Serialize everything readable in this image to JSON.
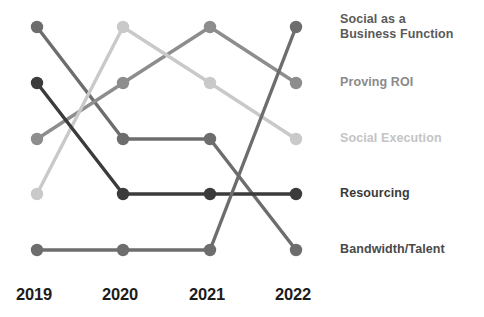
{
  "chart_data": {
    "type": "line",
    "subtype": "bump-chart",
    "title": "",
    "subtitle": "",
    "xlabel": "",
    "ylabel": "",
    "grid": false,
    "legend_position": "right",
    "categories": [
      "2019",
      "2020",
      "2021",
      "2022"
    ],
    "rank_axis": {
      "inverted": true,
      "min_rank": 1,
      "max_rank": 5,
      "note": "y position encodes rank; rank 1 is topmost"
    },
    "series": [
      {
        "name": "Bandwidth/Talent",
        "label": "Bandwidth/Talent",
        "color": "#6d6d6d",
        "label_color": "#4a4a4a",
        "values": [
          1,
          3,
          3,
          5
        ]
      },
      {
        "name": "Proving ROI",
        "label": "Proving ROI",
        "color": "#8d8d8d",
        "label_color": "#8a8a8a",
        "values": [
          3,
          2,
          1,
          2
        ]
      },
      {
        "name": "Social Execution",
        "label": "Social Execution",
        "color": "#c9c9c9",
        "label_color": "#c4c4c4",
        "values": [
          4,
          1,
          2,
          3
        ]
      },
      {
        "name": "Resourcing",
        "label": "Resourcing",
        "color": "#3b3b3b",
        "label_color": "#3a3a3a",
        "values": [
          2,
          4,
          4,
          4
        ]
      },
      {
        "name": "Social as a Business Function",
        "label": "Social as a\nBusiness Function",
        "color": "#6d6d6d",
        "label_color": "#5a5a5a",
        "values": [
          5,
          5,
          5,
          1
        ]
      }
    ]
  },
  "axis": {
    "years": [
      {
        "label": "2019"
      },
      {
        "label": "2020"
      },
      {
        "label": "2021"
      },
      {
        "label": "2022"
      }
    ]
  },
  "legend": {
    "entries": [
      {
        "label": "Bandwidth/Talent"
      },
      {
        "label": "Proving ROI"
      },
      {
        "label": "Social Execution"
      },
      {
        "label": "Resourcing"
      },
      {
        "label": "Social as a\nBusiness Function"
      }
    ]
  },
  "colors": {
    "background": "#ffffff",
    "axis_text": "#1c1c1c"
  }
}
